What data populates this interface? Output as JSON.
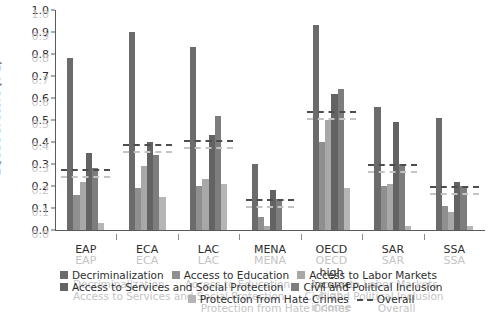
{
  "chart_data": {
    "type": "bar",
    "title": "",
    "xlabel": "",
    "ylabel": "EQOSOGI score (0-1)",
    "ylim": [
      0.0,
      1.0
    ],
    "grid": false,
    "legend_position": "bottom",
    "categories": [
      "EAP",
      "ECA",
      "LAC",
      "MENA",
      "OECD high income",
      "SAR",
      "SSA"
    ],
    "ytick_labels": [
      "0.0",
      "0.1",
      "0.2",
      "0.3",
      "0.4",
      "0.5",
      "0.6",
      "0.7",
      "0.8",
      "0.9",
      "1.0"
    ],
    "series": [
      {
        "name": "Decriminalization",
        "color": "#6b6b6b",
        "values": [
          0.78,
          0.9,
          0.83,
          0.3,
          0.93,
          0.56,
          0.51
        ]
      },
      {
        "name": "Access to Education",
        "color": "#8f8f8f",
        "values": [
          0.16,
          0.19,
          0.2,
          0.06,
          0.4,
          0.2,
          0.11
        ]
      },
      {
        "name": "Access to Labor Markets",
        "color": "#a8a8a8",
        "values": [
          0.22,
          0.29,
          0.23,
          0.02,
          0.5,
          0.21,
          0.08
        ]
      },
      {
        "name": "Access to Services and Social Protection",
        "color": "#636363",
        "values": [
          0.35,
          0.4,
          0.43,
          0.18,
          0.62,
          0.49,
          0.22
        ]
      },
      {
        "name": "Civil and Political Inclusion",
        "color": "#7d7d7d",
        "values": [
          0.28,
          0.34,
          0.52,
          0.14,
          0.64,
          0.3,
          0.2
        ]
      },
      {
        "name": "Protection from Hate Crimes",
        "color": "#b5b5b5",
        "values": [
          0.03,
          0.15,
          0.21,
          0.0,
          0.19,
          0.02,
          0.02
        ]
      }
    ],
    "overall": {
      "name": "Overall",
      "style": "dashed",
      "color": "#4d4d4d",
      "values": [
        0.27,
        0.38,
        0.4,
        0.13,
        0.53,
        0.29,
        0.19
      ]
    }
  },
  "legend": {
    "items": [
      {
        "label": "Decriminalization",
        "swatch": "#6b6b6b"
      },
      {
        "label": "Access to Education",
        "swatch": "#8f8f8f"
      },
      {
        "label": "Access to Labor Markets",
        "swatch": "#a8a8a8"
      },
      {
        "label": "Access to Services and Social Protection",
        "swatch": "#636363"
      },
      {
        "label": "Civil and Political Inclusion",
        "swatch": "#7d7d7d"
      },
      {
        "label": "Protection from Hate Crimes",
        "swatch": "#b5b5b5"
      },
      {
        "label": "Overall",
        "swatch": "dashed"
      }
    ]
  }
}
